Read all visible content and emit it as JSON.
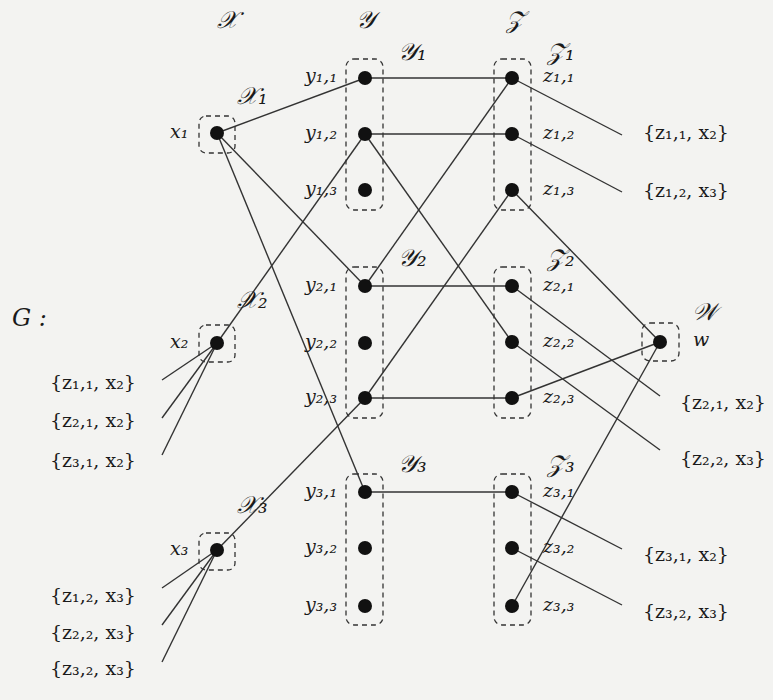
{
  "graph_label": "G :",
  "colors": {
    "background": "#f3f3f1",
    "ink": "#1a1a1a",
    "edge": "#333333"
  },
  "groups": {
    "X": "𝒳",
    "Y": "𝒴",
    "Z": "𝒵",
    "X1": "𝒳₁",
    "X2": "𝒳₂",
    "X3": "𝒳₃",
    "Y1": "𝒴₁",
    "Y2": "𝒴₂",
    "Y3": "𝒴₃",
    "Z1": "𝒵₁",
    "Z2": "𝒵₂",
    "Z3": "𝒵₃",
    "W": "𝒲"
  },
  "nodes": {
    "x1": "x₁",
    "x2": "x₂",
    "x3": "x₃",
    "y11": "y₁,₁",
    "y12": "y₁,₂",
    "y13": "y₁,₃",
    "y21": "y₂,₁",
    "y22": "y₂,₂",
    "y23": "y₂,₃",
    "y31": "y₃,₁",
    "y32": "y₃,₂",
    "y33": "y₃,₃",
    "z11": "z₁,₁",
    "z12": "z₁,₂",
    "z13": "z₁,₃",
    "z21": "z₂,₁",
    "z22": "z₂,₂",
    "z23": "z₂,₃",
    "z31": "z₃,₁",
    "z32": "z₃,₂",
    "z33": "z₃,₃",
    "w": "w"
  },
  "sets": {
    "right": [
      "{z₁,₁, x₂}",
      "{z₁,₂, x₃}",
      "{z₂,₁, x₂}",
      "{z₂,₂, x₃}",
      "{z₃,₁, x₂}",
      "{z₃,₂, x₃}"
    ],
    "left_x2": [
      "{z₁,₁, x₂}",
      "{z₂,₁, x₂}",
      "{z₃,₁, x₂}"
    ],
    "left_x3": [
      "{z₁,₂, x₃}",
      "{z₂,₂, x₃}",
      "{z₃,₂, x₃}"
    ]
  },
  "edges": [
    [
      "x1",
      "y11"
    ],
    [
      "x1",
      "y21"
    ],
    [
      "x1",
      "y31"
    ],
    [
      "x2",
      "y12"
    ],
    [
      "x3",
      "y23"
    ],
    [
      "y11",
      "z11"
    ],
    [
      "y12",
      "z12"
    ],
    [
      "y21",
      "z21"
    ],
    [
      "y23",
      "z23"
    ],
    [
      "y31",
      "z31"
    ],
    [
      "y21",
      "z11"
    ],
    [
      "y12",
      "z22"
    ],
    [
      "y23",
      "z13"
    ],
    [
      "z13",
      "w"
    ],
    [
      "z23",
      "w"
    ],
    [
      "z33",
      "w"
    ]
  ]
}
